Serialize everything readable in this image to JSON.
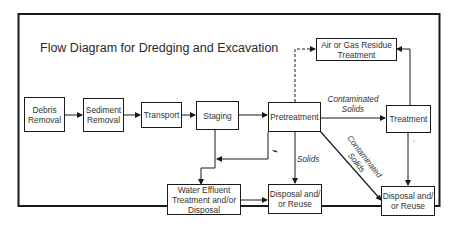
{
  "title": "Flow Diagram for Dredging and Excavation",
  "nodes": {
    "debris_removal": {
      "line1": "Debris",
      "line2": "Removal"
    },
    "sediment_removal": {
      "line1": "Sediment",
      "line2": "Removal"
    },
    "transport": {
      "line1": "Transport"
    },
    "staging": {
      "line1": "Staging"
    },
    "pretreatment": {
      "line1": "Pretreatment"
    },
    "treatment": {
      "line1": "Treatment"
    },
    "air_gas": {
      "line1": "Air or Gas Residue",
      "line2": "Treatment"
    },
    "water_effluent": {
      "line1": "Water Effluent",
      "line2": "Treatment and/or",
      "line3": "Disposal"
    },
    "disposal_mid": {
      "line1": "Disposal and/",
      "line2": "or Reuse"
    },
    "disposal_right": {
      "line1": "Disposal and/",
      "line2": "or Reuse"
    }
  },
  "edge_labels": {
    "pretreatment_to_treatment": {
      "line1": "Contaminated",
      "line2": "Solids"
    },
    "pretreatment_to_disposal_mid": "Solids",
    "pretreatment_to_disposal_right": {
      "line1": "Contaminated",
      "line2": "Solids"
    }
  },
  "edges": [
    {
      "from": "Debris Removal",
      "to": "Sediment Removal",
      "style": "solid"
    },
    {
      "from": "Sediment Removal",
      "to": "Transport",
      "style": "solid"
    },
    {
      "from": "Transport",
      "to": "Staging",
      "style": "solid"
    },
    {
      "from": "Staging",
      "to": "Pretreatment",
      "style": "solid"
    },
    {
      "from": "Pretreatment",
      "to": "Air or Gas Residue Treatment",
      "style": "dashed"
    },
    {
      "from": "Pretreatment",
      "to": "Treatment",
      "style": "solid",
      "label": "Contaminated Solids"
    },
    {
      "from": "Treatment",
      "to": "Air or Gas Residue Treatment",
      "style": "solid"
    },
    {
      "from": "Treatment",
      "to": "Disposal and/or Reuse (right)",
      "style": "solid"
    },
    {
      "from": "Pretreatment",
      "to": "Disposal and/or Reuse (middle)",
      "style": "solid",
      "label": "Solids"
    },
    {
      "from": "Pretreatment",
      "to": "Disposal and/or Reuse (right)",
      "style": "solid",
      "label": "Contaminated Solids"
    },
    {
      "from": "Pretreatment",
      "to": "junction",
      "style": "solid"
    },
    {
      "from": "Staging",
      "to": "Water Effluent Treatment and/or Disposal",
      "style": "solid"
    },
    {
      "from": "Water Effluent Treatment and/or Disposal",
      "to": "Disposal and/or Reuse (middle)",
      "style": "solid"
    }
  ],
  "colors": {
    "line": "#1a1a1a",
    "text": "#333333",
    "background": "#ffffff"
  }
}
